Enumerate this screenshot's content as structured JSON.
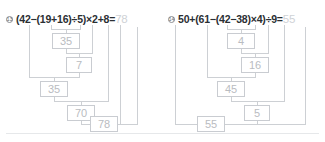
{
  "worksheet": {
    "divider_label": "section-divider",
    "box_border_color": "#c9ccd1",
    "box_text_color": "#b9bcc1",
    "line_color": "#cdd0d4",
    "expression_color": "#2b2f33",
    "answer_color": "#cfd2d6"
  },
  "problems": [
    {
      "number": "13",
      "expression": "(42−(19+16)÷5)×2+8=",
      "answer": "78",
      "steps": [
        {
          "label": "19+16",
          "value": "35"
        },
        {
          "label": "35÷5",
          "value": "7"
        },
        {
          "label": "42−7",
          "value": "35"
        },
        {
          "label": "35×2",
          "value": "70"
        },
        {
          "label": "70+8",
          "value": "78"
        }
      ]
    },
    {
      "number": "14",
      "expression": "50+(61−(42−38)×4)÷9=",
      "answer": "55",
      "steps": [
        {
          "label": "42−38",
          "value": "4"
        },
        {
          "label": "4×4",
          "value": "16"
        },
        {
          "label": "61−16",
          "value": "45"
        },
        {
          "label": "45÷9",
          "value": "5"
        },
        {
          "label": "50+5",
          "value": "55"
        }
      ]
    }
  ]
}
